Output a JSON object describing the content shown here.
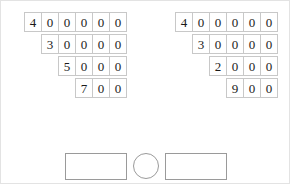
{
  "worksheet": {
    "title": "place-value digit decomposition worksheet",
    "ink_color": "#1a1a1a",
    "cell_border_color": "#c8c8c8",
    "shape_border_color": "#9a9a9a"
  },
  "groups": [
    {
      "name": "left-number-group",
      "rows": [
        {
          "digits": [
            "4",
            "0",
            "0",
            "0",
            "0",
            "0"
          ],
          "value": "400000"
        },
        {
          "digits": [
            "3",
            "0",
            "0",
            "0",
            "0"
          ],
          "value": "30000"
        },
        {
          "digits": [
            "5",
            "0",
            "0",
            "0"
          ],
          "value": "5000"
        },
        {
          "digits": [
            "7",
            "0",
            "0"
          ],
          "value": "700"
        }
      ]
    },
    {
      "name": "right-number-group",
      "rows": [
        {
          "digits": [
            "4",
            "0",
            "0",
            "0",
            "0",
            "0"
          ],
          "value": "400000"
        },
        {
          "digits": [
            "3",
            "0",
            "0",
            "0",
            "0"
          ],
          "value": "30000"
        },
        {
          "digits": [
            "2",
            "0",
            "0",
            "0"
          ],
          "value": "2000"
        },
        {
          "digits": [
            "9",
            "0",
            "0"
          ],
          "value": "900"
        }
      ]
    }
  ],
  "answer_area": {
    "left_box": {
      "value": ""
    },
    "operator": {
      "symbol": ""
    },
    "right_box": {
      "value": ""
    }
  }
}
